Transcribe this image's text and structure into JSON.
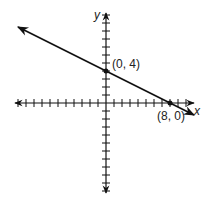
{
  "chart_data": {
    "type": "line",
    "title": "",
    "xlabel": "x",
    "ylabel": "y",
    "xlim": [
      -11,
      11
    ],
    "ylim": [
      -11,
      11
    ],
    "grid": false,
    "x_ticks": [
      -11,
      -10,
      -9,
      -8,
      -7,
      -6,
      -5,
      -4,
      -3,
      -2,
      -1,
      1,
      2,
      3,
      4,
      5,
      6,
      7,
      8,
      9,
      10
    ],
    "y_ticks": [
      -11,
      -10,
      -9,
      -8,
      -7,
      -6,
      -5,
      -4,
      -3,
      -2,
      -1,
      1,
      2,
      3,
      4,
      5,
      6,
      7,
      8,
      9,
      10,
      11
    ],
    "series": [
      {
        "name": "line",
        "equation": "y = -0.5x + 4",
        "x": [
          -11,
          11
        ],
        "y": [
          9.5,
          -1.5
        ],
        "arrows": "both"
      }
    ],
    "points": [
      {
        "x": 0,
        "y": 4,
        "label": "(0, 4)"
      },
      {
        "x": 8,
        "y": 0,
        "label": "(8, 0)"
      }
    ],
    "color": "#111111"
  }
}
